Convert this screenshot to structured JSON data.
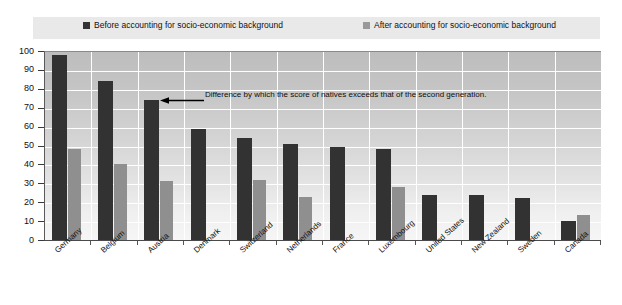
{
  "legend": {
    "before": {
      "label": "Before accounting for socio-economic background",
      "color": "#333333",
      "swatch_name": "legend-swatch-before"
    },
    "after": {
      "label": "After accounting for socio-economic background",
      "color": "#999999",
      "swatch_name": "legend-swatch-after"
    }
  },
  "annotation": {
    "text": "Difference by which the score of natives exceeds that of the second generation.",
    "arrow_icon": "left-arrow-icon"
  },
  "axis": {
    "y_ticks": [
      "100",
      "90",
      "80",
      "70",
      "60",
      "50",
      "40",
      "30",
      "20",
      "10",
      "0"
    ]
  },
  "chart_data": {
    "type": "bar",
    "title": "",
    "xlabel": "",
    "ylabel": "",
    "ylim": [
      0,
      100
    ],
    "ytick_step": 10,
    "grid": true,
    "legend_position": "top",
    "categories": [
      "Germany",
      "Belgium",
      "Austria",
      "Denmark",
      "Switzerland",
      "Netherlands",
      "France",
      "Luxembourg",
      "United States",
      "New Zealand",
      "Sweden",
      "Canada"
    ],
    "series": [
      {
        "name": "Before accounting for socio-economic background",
        "color": "#323232",
        "values": [
          98,
          84,
          74,
          59,
          54,
          51,
          49,
          48,
          24,
          24,
          22,
          10
        ]
      },
      {
        "name": "After accounting for socio-economic background",
        "color": "#8f8f8f",
        "values": [
          48,
          40,
          31,
          0,
          32,
          23,
          0,
          28,
          0,
          0,
          0,
          13
        ]
      }
    ]
  }
}
